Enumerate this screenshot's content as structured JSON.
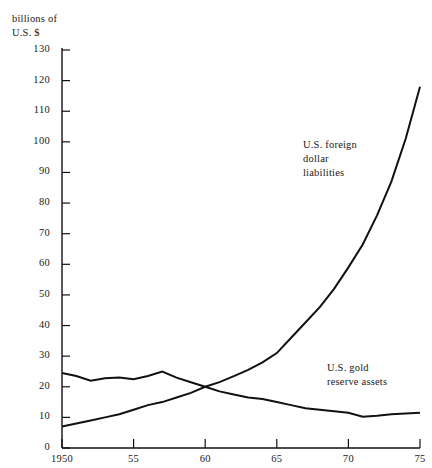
{
  "chart_data": {
    "type": "line",
    "title": "",
    "ylabel": "billions of\nU.S. $",
    "xlabel": "",
    "ylim": [
      0,
      130
    ],
    "xlim": [
      1950,
      1975
    ],
    "grid": false,
    "legend_position": "inline-annotations",
    "yticks": [
      0,
      10,
      20,
      30,
      40,
      50,
      60,
      70,
      80,
      90,
      100,
      110,
      120,
      130
    ],
    "ytick_labels": [
      "0",
      "10",
      "20",
      "30",
      "40",
      "50",
      "60",
      "70",
      "80",
      "90",
      "100",
      "110",
      "120",
      "130"
    ],
    "xticks": [
      1950,
      1955,
      1960,
      1965,
      1970,
      1975
    ],
    "xtick_labels": [
      "1950",
      "55",
      "60",
      "65",
      "70",
      "75"
    ],
    "series": [
      {
        "name": "U.S. foreign dollar liabilities",
        "label_text": "U.S. foreign\ndollar\nliabilities",
        "x": [
          1950,
          1951,
          1952,
          1953,
          1954,
          1955,
          1956,
          1957,
          1958,
          1959,
          1960,
          1961,
          1962,
          1963,
          1964,
          1965,
          1966,
          1967,
          1968,
          1969,
          1970,
          1971,
          1972,
          1973,
          1974,
          1975
        ],
        "values": [
          7,
          8,
          9,
          10,
          11,
          12.5,
          14,
          15,
          16.5,
          18,
          20,
          21.5,
          23.5,
          25.5,
          28,
          31,
          36,
          41,
          46,
          52,
          59,
          66.5,
          76,
          87,
          101,
          118
        ]
      },
      {
        "name": "U.S. gold reserve assets",
        "label_text": "U.S. gold\nreserve assets",
        "x": [
          1950,
          1951,
          1952,
          1953,
          1954,
          1955,
          1956,
          1957,
          1958,
          1959,
          1960,
          1961,
          1962,
          1963,
          1964,
          1965,
          1966,
          1967,
          1968,
          1969,
          1970,
          1971,
          1972,
          1973,
          1974,
          1975
        ],
        "values": [
          24.5,
          23.5,
          22,
          22.8,
          23,
          22.5,
          23.5,
          25,
          23,
          21.5,
          20,
          18.5,
          17.5,
          16.5,
          16,
          15,
          14,
          13,
          12.5,
          12,
          11.5,
          10.2,
          10.5,
          11,
          11.3,
          11.5
        ]
      }
    ],
    "colors": {
      "line": "#111111",
      "axis": "#111111",
      "background": "#ffffff"
    }
  }
}
